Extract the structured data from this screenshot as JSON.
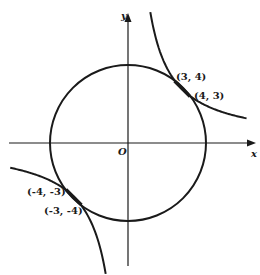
{
  "figure": {
    "axes": {
      "x_label": "x",
      "y_label": "y",
      "origin_label": "O"
    },
    "curves": [
      {
        "name": "circle",
        "equation": "x^2 + y^2 = 25",
        "radius": 5
      },
      {
        "name": "hyperbola",
        "equation": "xy = 12"
      }
    ],
    "points": [
      {
        "label": "(3, 4)",
        "x": 3,
        "y": 4
      },
      {
        "label": "(4, 3)",
        "x": 4,
        "y": 3
      },
      {
        "label": "(-4, -3)",
        "x": -4,
        "y": -3
      },
      {
        "label": "(-3, -4)",
        "x": -3,
        "y": -4
      }
    ],
    "colors": {
      "ink": "#1a1a1a",
      "background": "#ffffff"
    }
  }
}
